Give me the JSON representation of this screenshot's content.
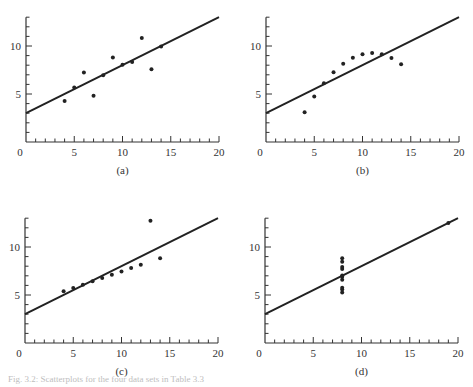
{
  "figure": {
    "caption": "Fig. 3.2: Scatterplots for the four data sets in Table 3.3"
  },
  "chart_data": [
    {
      "type": "scatter",
      "panel_label": "(a)",
      "title": "",
      "xlabel": "",
      "ylabel": "",
      "xlim": [
        0,
        20
      ],
      "ylim": [
        0,
        13
      ],
      "x_ticks": [
        0,
        5,
        10,
        15,
        20
      ],
      "y_ticks": [
        5,
        10
      ],
      "x": [
        4,
        5,
        6,
        7,
        8,
        9,
        10,
        11,
        12,
        13,
        14
      ],
      "y": [
        4.26,
        5.68,
        7.24,
        4.82,
        6.95,
        8.81,
        8.04,
        8.33,
        10.84,
        7.58,
        9.96
      ],
      "fit_line": {
        "intercept": 3.0,
        "slope": 0.5,
        "x_range": [
          0,
          20
        ]
      },
      "grid": false
    },
    {
      "type": "scatter",
      "panel_label": "(b)",
      "title": "",
      "xlabel": "",
      "ylabel": "",
      "xlim": [
        0,
        20
      ],
      "ylim": [
        0,
        13
      ],
      "x_ticks": [
        0,
        5,
        10,
        15,
        20
      ],
      "y_ticks": [
        5,
        10
      ],
      "x": [
        4,
        5,
        6,
        7,
        8,
        9,
        10,
        11,
        12,
        13,
        14
      ],
      "y": [
        3.1,
        4.74,
        6.13,
        7.26,
        8.14,
        8.77,
        9.14,
        9.26,
        9.13,
        8.74,
        8.1
      ],
      "fit_line": {
        "intercept": 3.0,
        "slope": 0.5,
        "x_range": [
          0,
          20
        ]
      },
      "grid": false
    },
    {
      "type": "scatter",
      "panel_label": "(c)",
      "title": "",
      "xlabel": "",
      "ylabel": "",
      "xlim": [
        0,
        20
      ],
      "ylim": [
        0,
        13
      ],
      "x_ticks": [
        0,
        5,
        10,
        15,
        20
      ],
      "y_ticks": [
        5,
        10
      ],
      "x": [
        4,
        5,
        6,
        7,
        8,
        9,
        10,
        11,
        12,
        13,
        14
      ],
      "y": [
        5.39,
        5.73,
        6.08,
        6.42,
        6.77,
        7.11,
        7.46,
        7.81,
        8.15,
        12.74,
        8.84
      ],
      "fit_line": {
        "intercept": 3.0,
        "slope": 0.5,
        "x_range": [
          0,
          20
        ]
      },
      "grid": false
    },
    {
      "type": "scatter",
      "panel_label": "(d)",
      "title": "",
      "xlabel": "",
      "ylabel": "",
      "xlim": [
        0,
        20
      ],
      "ylim": [
        0,
        13
      ],
      "x_ticks": [
        0,
        5,
        10,
        15,
        20
      ],
      "y_ticks": [
        5,
        10
      ],
      "x": [
        8,
        8,
        8,
        8,
        8,
        8,
        8,
        8,
        8,
        8,
        19
      ],
      "y": [
        5.25,
        5.56,
        5.76,
        6.58,
        6.89,
        7.04,
        7.71,
        7.91,
        8.47,
        8.84,
        12.5
      ],
      "fit_line": {
        "intercept": 3.0,
        "slope": 0.5,
        "x_range": [
          0,
          20
        ]
      },
      "grid": false
    }
  ],
  "layout": {
    "panels": [
      {
        "left": 0,
        "top": 0,
        "origin_x": 26,
        "origin_y": 142
      },
      {
        "left": 240,
        "top": 0,
        "origin_x": 26,
        "origin_y": 142
      },
      {
        "left": 0,
        "top": 201,
        "origin_x": 25,
        "origin_y": 142
      },
      {
        "left": 240,
        "top": 201,
        "origin_x": 25,
        "origin_y": 142
      }
    ],
    "px_per_x": 9.65,
    "px_per_y": 9.6,
    "axis_color": "#333333",
    "point_color": "#222222",
    "line_color": "#222222"
  }
}
